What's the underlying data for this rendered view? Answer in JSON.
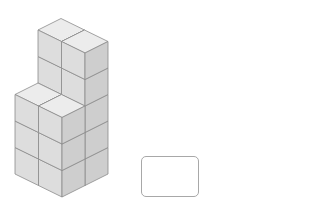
{
  "figure": {
    "origin": [
      62,
      197
    ],
    "axis_i": [
      -23.5,
      -11.5
    ],
    "axis_j": [
      23,
      -11.5
    ],
    "axis_k": [
      0,
      -26.5
    ],
    "blocks": [
      {
        "name": "back-block",
        "i": [
          0,
          2
        ],
        "j": [
          1,
          2
        ],
        "k": [
          0,
          5
        ]
      },
      {
        "name": "front-block",
        "i": [
          0,
          2
        ],
        "j": [
          0,
          1
        ],
        "k": [
          0,
          3
        ]
      }
    ],
    "colors": {
      "top": "#ececec",
      "left": "#dddddd",
      "right": "#cecece",
      "edge": "#8c8c8c"
    }
  },
  "answer_box": {
    "value": ""
  }
}
